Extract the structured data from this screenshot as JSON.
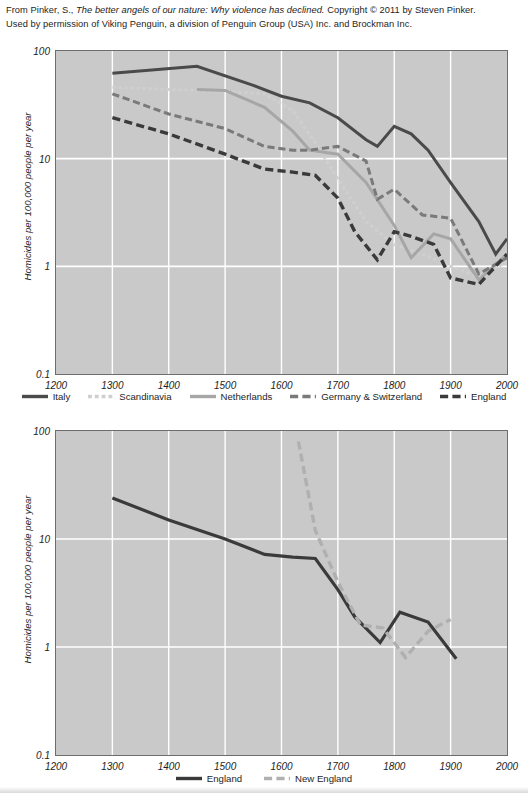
{
  "attribution": {
    "line1_pre": "From Pinker, S., ",
    "line1_title": "The better angels of our nature: Why violence has declined.",
    "line1_post": " Copyright © 2011 by Steven Pinker.",
    "line2": "Used by permission of Viking Penguin, a division of Penguin Group (USA) Inc. and Brockman Inc."
  },
  "colors": {
    "plot_background": "#c9c9c9",
    "gridline": "#ffffff",
    "axis_border": "#6d6d6d",
    "italy": "#4a4a4a",
    "scandinavia": "#cfcfcf",
    "netherlands": "#a6a6a6",
    "germany_switzerland": "#7a7a7a",
    "england": "#3a3a3a",
    "new_england": "#b0b0b0",
    "text": "#1d1d1d"
  },
  "chart_data": [
    {
      "id": "chart-europe",
      "type": "line",
      "title": "",
      "xlabel": "",
      "ylabel": "Homicides per 100,000 people per year",
      "xlim": [
        1200,
        2000
      ],
      "ylim": [
        0.1,
        100
      ],
      "yscale": "log",
      "grid": true,
      "legend_position": "bottom",
      "xticks": [
        1200,
        1300,
        1400,
        1500,
        1600,
        1700,
        1800,
        1900,
        2000
      ],
      "yticks": [
        0.1,
        1,
        10,
        100
      ],
      "ytick_labels": [
        "0.1",
        "1",
        "10",
        "100"
      ],
      "xtick_labels": [
        "1200",
        "1300",
        "1400",
        "1500",
        "1600",
        "1700",
        "1800",
        "1900",
        "2000"
      ],
      "series": [
        {
          "name": "Italy",
          "color": "#4a4a4a",
          "style": "solid",
          "width": 3.0,
          "x": [
            1300,
            1450,
            1550,
            1600,
            1650,
            1700,
            1750,
            1770,
            1800,
            1830,
            1860,
            1900,
            1950,
            1980,
            2000
          ],
          "y": [
            62,
            72,
            48,
            38,
            33,
            24,
            15,
            13,
            20,
            17,
            12,
            6.0,
            2.6,
            1.3,
            1.8
          ]
        },
        {
          "name": "Scandinavia",
          "color": "#cfcfcf",
          "style": "dotted",
          "width": 3.0,
          "x": [
            1300,
            1400,
            1450,
            1500,
            1570,
            1620,
            1660,
            1700,
            1750,
            1800,
            1850,
            1900,
            1950,
            2000
          ],
          "y": [
            46,
            44,
            43,
            42,
            40,
            28,
            14,
            6.5,
            2.6,
            1.6,
            1.3,
            1.0,
            0.8,
            1.1
          ]
        },
        {
          "name": "Netherlands",
          "color": "#a6a6a6",
          "style": "solid",
          "width": 3.0,
          "x": [
            1450,
            1500,
            1570,
            1620,
            1650,
            1700,
            1750,
            1800,
            1830,
            1870,
            1900,
            1950,
            2000
          ],
          "y": [
            44,
            43,
            30,
            18,
            12,
            11,
            6.0,
            2.4,
            1.2,
            2.0,
            1.8,
            0.75,
            1.3
          ]
        },
        {
          "name": "Germany & Switzerland",
          "color": "#7a7a7a",
          "style": "dashed",
          "width": 3.0,
          "x": [
            1300,
            1400,
            1500,
            1570,
            1620,
            1650,
            1700,
            1750,
            1770,
            1800,
            1850,
            1900,
            1950,
            2000
          ],
          "y": [
            40,
            26,
            19,
            13,
            12,
            12,
            13,
            9.5,
            4.2,
            5.2,
            3.0,
            2.8,
            0.85,
            1.2
          ]
        },
        {
          "name": "England",
          "color": "#3a3a3a",
          "style": "dashed",
          "width": 3.4,
          "x": [
            1300,
            1400,
            1500,
            1570,
            1620,
            1660,
            1700,
            1730,
            1770,
            1800,
            1830,
            1870,
            1900,
            1950,
            2000
          ],
          "y": [
            24,
            17,
            11,
            8.0,
            7.5,
            7.0,
            4.3,
            2.1,
            1.15,
            2.1,
            1.9,
            1.6,
            0.78,
            0.68,
            1.3
          ]
        }
      ],
      "legend": [
        {
          "label": "Italy",
          "color": "#4a4a4a",
          "style": "solid"
        },
        {
          "label": "Scandinavia",
          "color": "#cfcfcf",
          "style": "dotted"
        },
        {
          "label": "Netherlands",
          "color": "#a6a6a6",
          "style": "solid"
        },
        {
          "label": "Germany & Switzerland",
          "color": "#7a7a7a",
          "style": "dashed"
        },
        {
          "label": "England",
          "color": "#3a3a3a",
          "style": "dashed"
        }
      ]
    },
    {
      "id": "chart-england-newengland",
      "type": "line",
      "title": "",
      "xlabel": "",
      "ylabel": "Homicides per 100,000 people per year",
      "xlim": [
        1200,
        2000
      ],
      "ylim": [
        0.1,
        100
      ],
      "yscale": "log",
      "grid": true,
      "legend_position": "bottom",
      "xticks": [
        1200,
        1300,
        1400,
        1500,
        1600,
        1700,
        1800,
        1900,
        2000
      ],
      "yticks": [
        0.1,
        1,
        10,
        100
      ],
      "ytick_labels": [
        "0.1",
        "1",
        "10",
        "100"
      ],
      "xtick_labels": [
        "1200",
        "1300",
        "1400",
        "1500",
        "1600",
        "1700",
        "1800",
        "1900",
        "2000"
      ],
      "series": [
        {
          "name": "England",
          "color": "#3a3a3a",
          "style": "solid",
          "width": 3.2,
          "x": [
            1300,
            1400,
            1500,
            1570,
            1620,
            1660,
            1700,
            1730,
            1775,
            1810,
            1860,
            1910
          ],
          "y": [
            24,
            15,
            10,
            7.2,
            6.8,
            6.6,
            3.4,
            1.9,
            1.1,
            2.1,
            1.7,
            0.78
          ]
        },
        {
          "name": "New England",
          "color": "#b0b0b0",
          "style": "dashed",
          "width": 3.4,
          "x": [
            1630,
            1660,
            1700,
            1740,
            1780,
            1820,
            1860,
            1900
          ],
          "y": [
            80,
            12,
            4.0,
            1.6,
            1.5,
            0.8,
            1.4,
            1.8
          ]
        }
      ],
      "legend": [
        {
          "label": "England",
          "color": "#3a3a3a",
          "style": "solid"
        },
        {
          "label": "New England",
          "color": "#b0b0b0",
          "style": "dashed"
        }
      ]
    }
  ]
}
